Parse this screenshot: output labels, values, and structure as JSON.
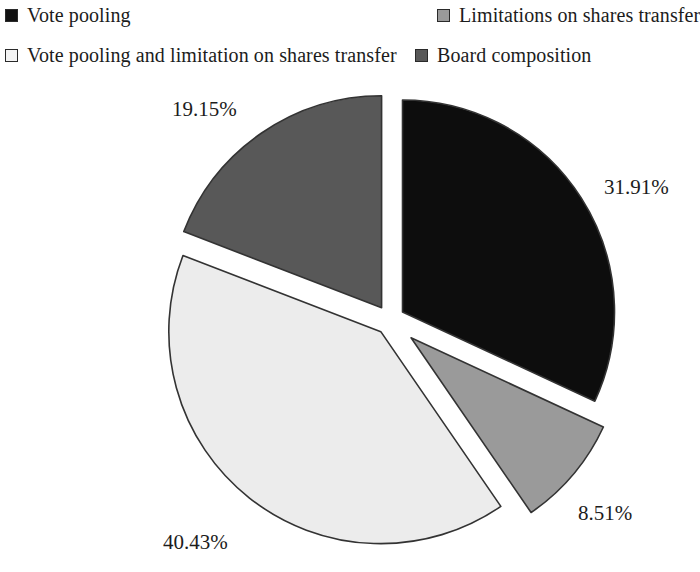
{
  "chart_data": {
    "type": "pie",
    "title": "",
    "subtitle": "",
    "xlabel": "",
    "ylabel": "",
    "legend_position": "top",
    "grid": false,
    "exploded": true,
    "start_angle_deg": 0,
    "direction": "clockwise",
    "categories": [
      "Vote pooling",
      "Limitations on shares transfer",
      "Vote pooling and limitation on shares transfer",
      "Board composition"
    ],
    "values": [
      31.91,
      8.51,
      40.43,
      19.15
    ],
    "value_labels": [
      "31.91%",
      "8.51%",
      "40.43%",
      "19.15%"
    ],
    "colors": [
      "#0d0d0d",
      "#9a9a9a",
      "#ececec",
      "#585858"
    ],
    "slices": [
      {
        "label": "Vote pooling",
        "value": 31.91,
        "value_label": "31.91%",
        "color": "#0d0d0d",
        "start_deg": 0,
        "end_deg": 114.876,
        "explode": 0.07
      },
      {
        "label": "Limitations on shares transfer",
        "value": 8.51,
        "value_label": "8.51%",
        "color": "#9a9a9a",
        "start_deg": 114.876,
        "end_deg": 145.512,
        "explode": 0.13
      },
      {
        "label": "Vote pooling and limitation on shares transfer",
        "value": 40.43,
        "value_label": "40.43%",
        "color": "#ececec",
        "start_deg": 145.512,
        "end_deg": 291.06,
        "explode": 0.07
      },
      {
        "label": "Board composition",
        "value": 19.15,
        "value_label": "19.15%",
        "color": "#585858",
        "start_deg": 291.06,
        "end_deg": 360.0,
        "explode": 0.07
      }
    ]
  },
  "legend": {
    "items": [
      {
        "label": "Vote pooling",
        "color": "#111111",
        "marker": "filled-square-marker"
      },
      {
        "label": "Limitations on shares transfer",
        "color": "#9a9a9a",
        "marker": "filled-square-marker"
      },
      {
        "label": "Vote pooling and limitation on shares transfer",
        "color": "#f4f4f4",
        "marker": "filled-square-marker"
      },
      {
        "label": "Board composition",
        "color": "#585858",
        "marker": "filled-square-marker"
      }
    ]
  },
  "geometry": {
    "center_x": 390,
    "center_y": 248,
    "radius": 212,
    "stroke": "#333333"
  }
}
